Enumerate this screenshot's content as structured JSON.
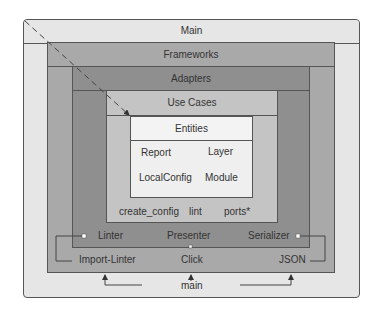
{
  "diagram": {
    "layers": {
      "main": {
        "title": "Main",
        "items": [
          "Import-Linter",
          "Click",
          "JSON"
        ]
      },
      "frameworks": {
        "title": "Frameworks"
      },
      "adapters": {
        "title": "Adapters",
        "items": [
          "Linter",
          "Presenter",
          "Serializer"
        ]
      },
      "use_cases": {
        "title": "Use Cases",
        "items": [
          "create_config",
          "lint",
          "ports*"
        ]
      },
      "entities": {
        "title": "Entities",
        "items": [
          "Report",
          "Layer",
          "LocalConfig",
          "Module"
        ]
      }
    },
    "entry_point": "main",
    "colors": {
      "main": "#e6e6e6",
      "frameworks": "#a9a9a9",
      "adapters": "#8f8f8f",
      "use_cases": "#c4c4c4",
      "entities": "#efefef",
      "border": "#555555"
    }
  }
}
